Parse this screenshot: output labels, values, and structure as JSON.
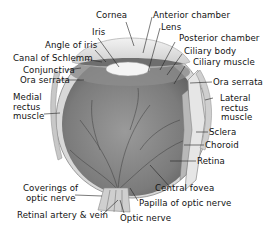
{
  "diagram": {
    "labels": {
      "cornea": "Cornea",
      "iris": "Iris",
      "angle_of_iris": "Angle of iris",
      "canal_of_schlemm": "Canal of Schlemm",
      "conjunctiva": "Conjunctiva",
      "ora_serrata_left": "Ora serrata",
      "medial_rectus_1": "Medial",
      "medial_rectus_2": "rectus",
      "medial_rectus_3": "muscle",
      "anterior_chamber": "Anterior chamber",
      "lens": "Lens",
      "posterior_chamber": "Posterior chamber",
      "ciliary_body": "Ciliary body",
      "ciliary_muscle": "Ciliary muscle",
      "ora_serrata_right": "Ora serrata",
      "lateral_rectus_1": "Lateral",
      "lateral_rectus_2": "rectus",
      "lateral_rectus_3": "muscle",
      "sclera": "Sclera",
      "choroid": "Choroid",
      "retina": "Retina",
      "coverings_1": "Coverings of",
      "coverings_2": "optic nerve",
      "retinal_artery_vein": "Retinal artery & vein",
      "central_fovea": "Central fovea",
      "papilla": "Papilla of optic nerve",
      "optic_nerve": "Optic nerve"
    }
  }
}
